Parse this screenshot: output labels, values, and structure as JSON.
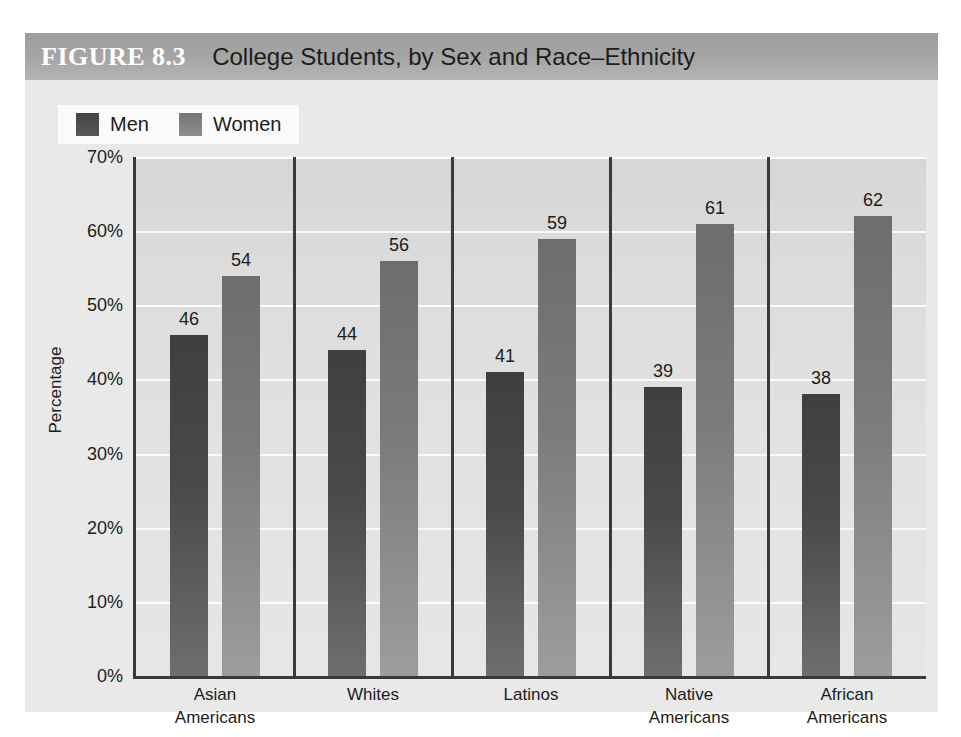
{
  "figure": {
    "number": "FIGURE 8.3",
    "title": "College Students, by Sex and Race–Ethnicity"
  },
  "chart_data": {
    "type": "bar",
    "title": "College Students, by Sex and Race–Ethnicity",
    "xlabel": "",
    "ylabel": "Percentage",
    "ylim": [
      0,
      70
    ],
    "ytick_labels": [
      "70%",
      "60%",
      "50%",
      "40%",
      "30%",
      "20%",
      "10%",
      "0%"
    ],
    "ytick_values": [
      70,
      60,
      50,
      40,
      30,
      20,
      10,
      0
    ],
    "grid": true,
    "legend_position": "top-left",
    "categories": [
      "Asian\nAmericans",
      "Whites",
      "Latinos",
      "Native\nAmericans",
      "African\nAmericans"
    ],
    "category_lines": [
      [
        "Asian",
        "Americans"
      ],
      [
        "Whites",
        ""
      ],
      [
        "Latinos",
        ""
      ],
      [
        "Native",
        "Americans"
      ],
      [
        "African",
        "Americans"
      ]
    ],
    "series": [
      {
        "name": "Men",
        "color": "#4a4a4a",
        "values": [
          46,
          44,
          41,
          39,
          38
        ]
      },
      {
        "name": "Women",
        "color": "#7c7c7c",
        "values": [
          54,
          56,
          59,
          61,
          62
        ]
      }
    ]
  },
  "legend": {
    "men_label": "Men",
    "women_label": "Women"
  },
  "colors": {
    "header_bar": "#a6a6a6",
    "plot_background": "#dedede",
    "gridline": "#fbfbfb",
    "axis": "#3a3a3a",
    "men_bar": "#4a4a4a",
    "women_bar": "#7c7c7c"
  }
}
